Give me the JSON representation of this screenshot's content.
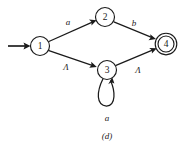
{
  "figure": {
    "caption": "(d)",
    "background_color": "#ffffff",
    "ink_color": "#1a1a1a"
  },
  "diagram": {
    "type": "finite-automaton-state-diagram",
    "states": [
      {
        "id": "1",
        "label": "1",
        "cx": 40,
        "cy": 46,
        "r": 9.5,
        "accepting": false,
        "start": true
      },
      {
        "id": "2",
        "label": "2",
        "cx": 105,
        "cy": 17,
        "r": 9.5,
        "accepting": false,
        "start": false
      },
      {
        "id": "3",
        "label": "3",
        "cx": 107,
        "cy": 70,
        "r": 9.5,
        "accepting": false,
        "start": false
      },
      {
        "id": "4",
        "label": "4",
        "cx": 166,
        "cy": 44,
        "r": 9.5,
        "accepting": true,
        "start": false
      }
    ],
    "transitions": [
      {
        "from": "1",
        "to": "2",
        "label": "a",
        "label_x": 68,
        "label_y": 22
      },
      {
        "from": "2",
        "to": "4",
        "label": "b",
        "label_x": 134,
        "label_y": 23
      },
      {
        "from": "1",
        "to": "3",
        "label": "Λ",
        "label_x": 66,
        "label_y": 67
      },
      {
        "from": "3",
        "to": "4",
        "label": "Λ",
        "label_x": 138,
        "label_y": 70
      },
      {
        "from": "3",
        "to": "3",
        "label": "a",
        "label_x": 107,
        "label_y": 118,
        "self_loop": true
      }
    ],
    "start_arrow": {
      "x1": 8,
      "y1": 46,
      "x2": 29,
      "y2": 46
    }
  }
}
